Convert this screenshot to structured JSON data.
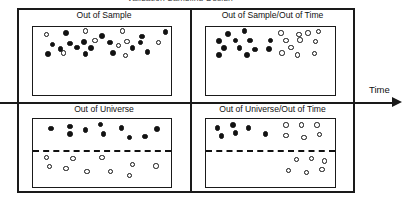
{
  "figure": {
    "clipped_title": "Validation Sampling Design",
    "axis": {
      "label": "Time",
      "orientation": "horizontal",
      "arrow_direction": "right"
    },
    "legend_semantics": {
      "filled_dot": "in-sample observation",
      "hollow_dot": "out-of-sample observation"
    },
    "colors": {
      "ink": "#1a1a1a",
      "dot_fill": "#121212",
      "dot_hollow": "#ffffff",
      "background": "#ffffff"
    }
  },
  "quadrants": [
    {
      "id": "out-of-sample",
      "label": "Out of Sample",
      "has_divider": false,
      "dots": [
        {
          "x": 10,
          "y": 11,
          "type": "hollow"
        },
        {
          "x": 24,
          "y": 9,
          "type": "filled"
        },
        {
          "x": 38,
          "y": 6,
          "type": "hollow"
        },
        {
          "x": 50,
          "y": 13,
          "type": "filled"
        },
        {
          "x": 65,
          "y": 6,
          "type": "hollow"
        },
        {
          "x": 79,
          "y": 14,
          "type": "filled"
        },
        {
          "x": 96,
          "y": 7,
          "type": "filled"
        },
        {
          "x": 14,
          "y": 26,
          "type": "filled"
        },
        {
          "x": 27,
          "y": 24,
          "type": "filled"
        },
        {
          "x": 37,
          "y": 22,
          "type": "filled"
        },
        {
          "x": 45,
          "y": 20,
          "type": "hollow"
        },
        {
          "x": 56,
          "y": 23,
          "type": "filled"
        },
        {
          "x": 68,
          "y": 21,
          "type": "hollow"
        },
        {
          "x": 78,
          "y": 23,
          "type": "filled"
        },
        {
          "x": 91,
          "y": 23,
          "type": "hollow"
        },
        {
          "x": 20,
          "y": 32,
          "type": "filled"
        },
        {
          "x": 32,
          "y": 30,
          "type": "filled"
        },
        {
          "x": 42,
          "y": 31,
          "type": "filled"
        },
        {
          "x": 62,
          "y": 27,
          "type": "hollow"
        },
        {
          "x": 72,
          "y": 31,
          "type": "filled"
        },
        {
          "x": 11,
          "y": 40,
          "type": "filled"
        },
        {
          "x": 22,
          "y": 38,
          "type": "hollow"
        },
        {
          "x": 38,
          "y": 40,
          "type": "filled"
        },
        {
          "x": 58,
          "y": 38,
          "type": "filled"
        },
        {
          "x": 67,
          "y": 42,
          "type": "hollow"
        },
        {
          "x": 83,
          "y": 37,
          "type": "filled"
        }
      ]
    },
    {
      "id": "out-of-sample-out-of-time",
      "label": "Out of Sample/Out of Time",
      "has_divider": false,
      "dots": [
        {
          "x": 17,
          "y": 10,
          "type": "filled"
        },
        {
          "x": 30,
          "y": 6,
          "type": "filled"
        },
        {
          "x": 58,
          "y": 9,
          "type": "hollow"
        },
        {
          "x": 72,
          "y": 11,
          "type": "hollow"
        },
        {
          "x": 79,
          "y": 9,
          "type": "hollow"
        },
        {
          "x": 87,
          "y": 7,
          "type": "hollow"
        },
        {
          "x": 10,
          "y": 21,
          "type": "filled"
        },
        {
          "x": 23,
          "y": 20,
          "type": "filled"
        },
        {
          "x": 34,
          "y": 20,
          "type": "filled"
        },
        {
          "x": 50,
          "y": 20,
          "type": "filled"
        },
        {
          "x": 62,
          "y": 20,
          "type": "hollow"
        },
        {
          "x": 73,
          "y": 19,
          "type": "hollow"
        },
        {
          "x": 85,
          "y": 21,
          "type": "hollow"
        },
        {
          "x": 14,
          "y": 31,
          "type": "filled"
        },
        {
          "x": 26,
          "y": 31,
          "type": "filled"
        },
        {
          "x": 38,
          "y": 33,
          "type": "filled"
        },
        {
          "x": 49,
          "y": 32,
          "type": "filled"
        },
        {
          "x": 66,
          "y": 30,
          "type": "hollow"
        },
        {
          "x": 10,
          "y": 41,
          "type": "filled"
        },
        {
          "x": 32,
          "y": 41,
          "type": "filled"
        },
        {
          "x": 59,
          "y": 38,
          "type": "hollow"
        },
        {
          "x": 71,
          "y": 41,
          "type": "hollow"
        },
        {
          "x": 84,
          "y": 39,
          "type": "hollow"
        }
      ]
    },
    {
      "id": "out-of-universe",
      "label": "Out of Universe",
      "has_divider": true,
      "divider_y_pct": 46,
      "dots": [
        {
          "x": 13,
          "y": 14,
          "type": "filled"
        },
        {
          "x": 27,
          "y": 11,
          "type": "filled"
        },
        {
          "x": 27,
          "y": 22,
          "type": "filled"
        },
        {
          "x": 38,
          "y": 16,
          "type": "filled"
        },
        {
          "x": 49,
          "y": 8,
          "type": "filled"
        },
        {
          "x": 51,
          "y": 22,
          "type": "filled"
        },
        {
          "x": 64,
          "y": 13,
          "type": "filled"
        },
        {
          "x": 70,
          "y": 27,
          "type": "filled"
        },
        {
          "x": 81,
          "y": 26,
          "type": "filled"
        },
        {
          "x": 90,
          "y": 15,
          "type": "filled"
        },
        {
          "x": 10,
          "y": 57,
          "type": "hollow"
        },
        {
          "x": 12,
          "y": 70,
          "type": "hollow"
        },
        {
          "x": 24,
          "y": 73,
          "type": "hollow"
        },
        {
          "x": 29,
          "y": 58,
          "type": "hollow"
        },
        {
          "x": 39,
          "y": 77,
          "type": "hollow"
        },
        {
          "x": 50,
          "y": 57,
          "type": "hollow"
        },
        {
          "x": 56,
          "y": 77,
          "type": "hollow"
        },
        {
          "x": 70,
          "y": 83,
          "type": "hollow"
        },
        {
          "x": 72,
          "y": 67,
          "type": "hollow"
        },
        {
          "x": 89,
          "y": 69,
          "type": "hollow"
        }
      ]
    },
    {
      "id": "out-of-universe-out-of-time",
      "label": "Out of Universe/Out of Time",
      "has_divider": true,
      "divider_y_pct": 46,
      "dots": [
        {
          "x": 9,
          "y": 13,
          "type": "filled"
        },
        {
          "x": 21,
          "y": 9,
          "type": "filled"
        },
        {
          "x": 23,
          "y": 21,
          "type": "filled"
        },
        {
          "x": 12,
          "y": 25,
          "type": "filled"
        },
        {
          "x": 33,
          "y": 13,
          "type": "filled"
        },
        {
          "x": 46,
          "y": 22,
          "type": "filled"
        },
        {
          "x": 62,
          "y": 9,
          "type": "hollow"
        },
        {
          "x": 74,
          "y": 9,
          "type": "hollow"
        },
        {
          "x": 86,
          "y": 9,
          "type": "hollow"
        },
        {
          "x": 62,
          "y": 24,
          "type": "hollow"
        },
        {
          "x": 76,
          "y": 27,
          "type": "hollow"
        },
        {
          "x": 88,
          "y": 23,
          "type": "hollow"
        },
        {
          "x": 70,
          "y": 60,
          "type": "hollow"
        },
        {
          "x": 82,
          "y": 58,
          "type": "hollow"
        },
        {
          "x": 92,
          "y": 62,
          "type": "hollow"
        },
        {
          "x": 64,
          "y": 76,
          "type": "hollow"
        },
        {
          "x": 78,
          "y": 79,
          "type": "hollow"
        },
        {
          "x": 90,
          "y": 74,
          "type": "hollow"
        }
      ]
    }
  ]
}
